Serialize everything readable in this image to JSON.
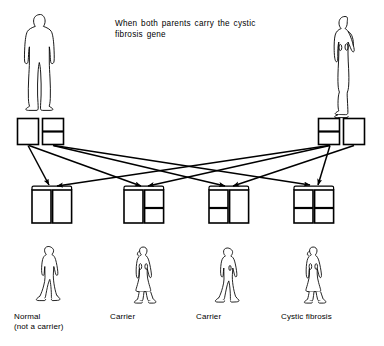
{
  "title": {
    "line1": "When both parents carry the cystic",
    "line2": "fibrosis gene"
  },
  "colors": {
    "stroke": "#000000",
    "background": "#ffffff",
    "gene_normal_fill": "#ffffff",
    "gene_carrier_band": "#000000"
  },
  "parents": [
    {
      "name": "father",
      "figure": "male-standing-front",
      "genes": [
        {
          "type": "normal",
          "label": "normal gene"
        },
        {
          "type": "carrier",
          "label": "cystic fibrosis gene"
        }
      ]
    },
    {
      "name": "mother",
      "figure": "female-standing-profile",
      "genes": [
        {
          "type": "carrier",
          "label": "cystic fibrosis gene"
        },
        {
          "type": "normal",
          "label": "normal gene"
        }
      ]
    }
  ],
  "offspring": [
    {
      "index": 0,
      "figure": "child-walking-male",
      "genes": [
        {
          "type": "normal"
        },
        {
          "type": "normal"
        }
      ],
      "label": "Normal\n(not a carrier)"
    },
    {
      "index": 1,
      "figure": "child-walking-female",
      "genes": [
        {
          "type": "normal"
        },
        {
          "type": "carrier"
        }
      ],
      "label": "Carrier"
    },
    {
      "index": 2,
      "figure": "child-walking-male",
      "genes": [
        {
          "type": "carrier"
        },
        {
          "type": "normal"
        }
      ],
      "label": "Carrier"
    },
    {
      "index": 3,
      "figure": "child-walking-female",
      "genes": [
        {
          "type": "carrier"
        },
        {
          "type": "carrier"
        }
      ],
      "label": "Cystic fibrosis"
    }
  ],
  "inheritance_arrows": [
    {
      "from": "father-gene-normal",
      "to": "offspring-0"
    },
    {
      "from": "father-gene-normal",
      "to": "offspring-1"
    },
    {
      "from": "father-gene-carrier",
      "to": "offspring-2"
    },
    {
      "from": "father-gene-carrier",
      "to": "offspring-3"
    },
    {
      "from": "mother-gene-carrier",
      "to": "offspring-0"
    },
    {
      "from": "mother-gene-carrier",
      "to": "offspring-1"
    },
    {
      "from": "mother-gene-normal",
      "to": "offspring-2"
    },
    {
      "from": "mother-gene-normal",
      "to": "offspring-3"
    }
  ]
}
